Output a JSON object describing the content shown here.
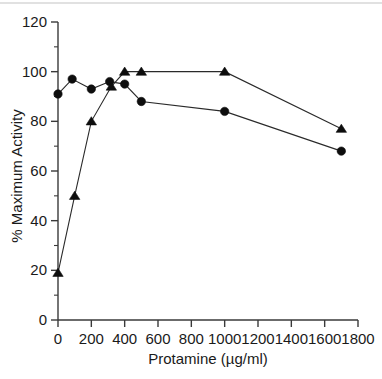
{
  "chart_data": {
    "type": "line",
    "title": "",
    "subtitle": "",
    "xlabel": "Protamine  (µg/ml)",
    "ylabel": "% Maximum Activity",
    "xlim": [
      0,
      1800
    ],
    "ylim": [
      0,
      120
    ],
    "xticks": [
      0,
      200,
      400,
      600,
      800,
      1000,
      1200,
      1400,
      1600,
      1800
    ],
    "xtick_labels": [
      "0",
      "200",
      "400",
      "600",
      "800",
      "1000",
      "1200",
      "1400",
      "1600",
      "1800"
    ],
    "yticks": [
      0,
      20,
      40,
      60,
      80,
      100,
      120
    ],
    "ytick_labels": [
      "0",
      "20",
      "40",
      "60",
      "80",
      "100",
      "120"
    ],
    "y_minor_ticks": [
      10,
      30,
      50,
      70,
      90,
      110
    ],
    "grid": false,
    "legend": "none",
    "series": [
      {
        "name": "circle-series",
        "marker": "circle",
        "color": "#0d0d0d",
        "x": [
          0,
          85,
          200,
          310,
          400,
          500,
          1000,
          1700
        ],
        "values": [
          91,
          97,
          93,
          96,
          95,
          88,
          84,
          68
        ]
      },
      {
        "name": "triangle-series",
        "marker": "triangle",
        "color": "#0d0d0d",
        "x": [
          0,
          100,
          200,
          320,
          400,
          500,
          1000,
          1700
        ],
        "values": [
          19,
          50,
          80,
          94,
          100,
          100,
          100,
          77
        ]
      }
    ]
  }
}
